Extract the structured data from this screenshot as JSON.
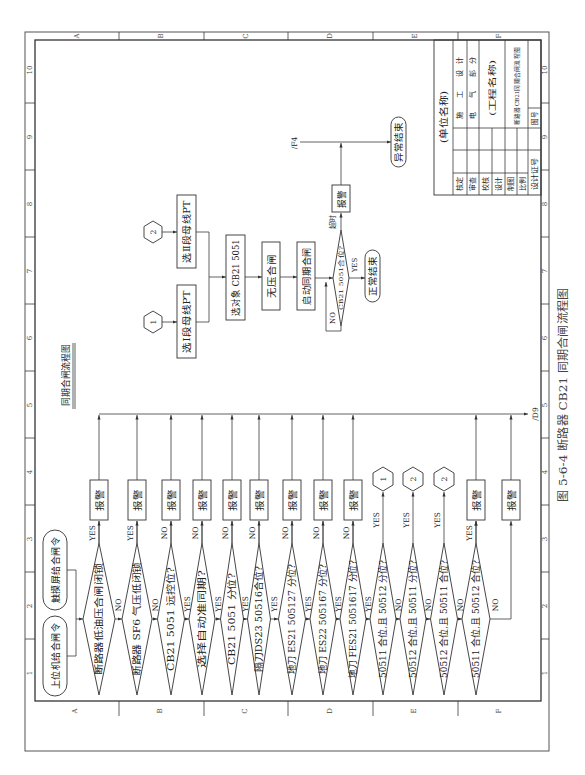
{
  "figure_caption": "图 5-6-4  断路器 CB21 同期合闸流程图",
  "drawing": {
    "title": "同期合闸流程图",
    "start_nodes": {
      "host_command": "上位机给合闸令",
      "touchscreen_command": "触摸屏给合闸令"
    },
    "checks": [
      {
        "text": "断路器低油压合闸闭锁",
        "exit_label": "YES",
        "next_label": "NO"
      },
      {
        "text": "断路器 SF6 气压低闭锁",
        "exit_label": "YES",
        "next_label": "NO"
      },
      {
        "text": "CB21 5051 远控位?",
        "exit_label": "NO",
        "next_label": "YES"
      },
      {
        "text": "选择自动准同期?",
        "exit_label": "NO",
        "next_label": "YES"
      },
      {
        "text": "CB21 5051 分位?",
        "exit_label": "NO",
        "next_label": "YES"
      },
      {
        "text": "隔刀DS23 50516合位?",
        "exit_label": "NO",
        "next_label": "YES"
      },
      {
        "text": "地刀 ES21 505127 分位?",
        "exit_label": "NO",
        "next_label": "YES"
      },
      {
        "text": "地刀 ES22 505167 分位?",
        "exit_label": "NO",
        "next_label": "YES"
      },
      {
        "text": "地刀 FES21 5051617 分位?",
        "exit_label": "NO",
        "next_label": "YES"
      },
      {
        "text": "50511 合位,且 50512 分位?",
        "exit_label": "YES",
        "next_label": "NO"
      },
      {
        "text": "50512 合位,且 50511 分位?",
        "exit_label": "YES",
        "next_label": "NO"
      },
      {
        "text": "50512 合位,且 50511 合位?",
        "exit_label": "YES",
        "next_label": "NO"
      },
      {
        "text": "50511 合位,且 50512 合位?",
        "exit_label": "YES",
        "next_label": "NO"
      }
    ],
    "alarm": "报警",
    "connectors": [
      "1",
      "2",
      "2"
    ],
    "offpage_ref_out": "/D9",
    "pt_flow": {
      "connector_1": "1",
      "connector_2": "2",
      "select_bus1_pt": "选Ⅰ段母线PT",
      "select_bus2_pt": "选Ⅱ段母线PT",
      "select_object": "选对象 CB21 5051",
      "dead_bus_close": "无压合闸",
      "start_sync_close": "启动同期合闸",
      "decision": "CB21 5051合位?",
      "decision_yes": "YES",
      "decision_no": "NO",
      "timeout_label": "超时",
      "alarm": "报警",
      "normal_end": "正常结束",
      "abnormal_end": "异常结束",
      "offpage_ref_in": "/F4"
    }
  },
  "frame": {
    "zone_letters": [
      "A",
      "B",
      "C",
      "D",
      "E",
      "F"
    ],
    "zone_numbers": [
      "10",
      "9",
      "8",
      "7",
      "6",
      "5",
      "4",
      "3",
      "2",
      "1"
    ]
  },
  "title_block": {
    "org_name": "(单位名称)",
    "sign_rows": [
      "核定",
      "审查",
      "校核",
      "设计",
      "制图",
      "比例",
      "设计证号"
    ],
    "stage": "施 工 设计",
    "discipline": "电 气 部分",
    "project_name": "(工程名称)",
    "drawing_name": "断路器CB21同期合闸流程图",
    "drawing_no_label": "图号"
  }
}
